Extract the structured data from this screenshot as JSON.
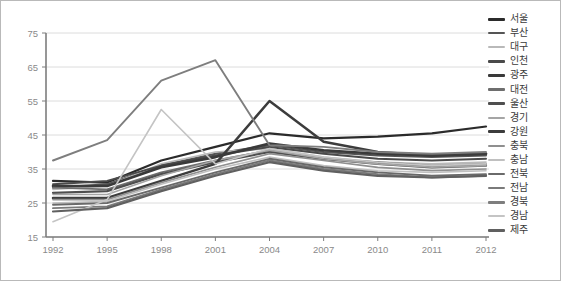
{
  "chart_data": {
    "type": "line",
    "title": "",
    "xlabel": "",
    "ylabel": "",
    "categories": [
      "1992",
      "1995",
      "1998",
      "2001",
      "2004",
      "2007",
      "2010",
      "2011",
      "2012"
    ],
    "x": [
      1992,
      1995,
      1998,
      2001,
      2004,
      2007,
      2010,
      2011,
      2012
    ],
    "ylim": [
      15,
      75
    ],
    "yticks": [
      15,
      25,
      35,
      45,
      55,
      65,
      75
    ],
    "grid": "horizontal",
    "legend_position": "right",
    "series": [
      {
        "name": "서울",
        "color": "#2b2b2b",
        "width": 2.2,
        "values": [
          31.5,
          31.0,
          37.5,
          41.5,
          45.5,
          44.0,
          44.5,
          45.5,
          47.5
        ]
      },
      {
        "name": "부산",
        "color": "#555555",
        "width": 2.0,
        "values": [
          29.5,
          30.5,
          36.0,
          39.5,
          42.0,
          40.0,
          39.0,
          38.5,
          39.0
        ]
      },
      {
        "name": "대구",
        "color": "#b9b9b9",
        "width": 1.7,
        "values": [
          29.0,
          30.0,
          36.5,
          40.0,
          41.0,
          38.5,
          37.0,
          36.5,
          37.0
        ]
      },
      {
        "name": "인천",
        "color": "#4a4a4a",
        "width": 2.0,
        "values": [
          30.5,
          31.5,
          36.0,
          39.0,
          41.5,
          39.5,
          38.0,
          37.5,
          38.0
        ]
      },
      {
        "name": "광주",
        "color": "#3a3a3a",
        "width": 2.6,
        "values": [
          30.0,
          30.0,
          35.5,
          38.5,
          42.5,
          40.5,
          39.5,
          39.0,
          39.5
        ]
      },
      {
        "name": "대전",
        "color": "#6e6e6e",
        "width": 1.8,
        "values": [
          29.5,
          29.0,
          34.0,
          37.5,
          40.5,
          38.0,
          37.0,
          36.0,
          36.5
        ]
      },
      {
        "name": "울산",
        "color": "#4f4f4f",
        "width": 2.2,
        "values": [
          28.0,
          28.5,
          33.5,
          37.0,
          40.0,
          38.0,
          36.5,
          35.5,
          36.0
        ]
      },
      {
        "name": "경기",
        "color": "#a5a5a5",
        "width": 1.6,
        "values": [
          27.5,
          27.5,
          33.0,
          37.5,
          40.5,
          38.0,
          36.5,
          35.5,
          36.0
        ]
      },
      {
        "name": "강원",
        "color": "#3c3c3c",
        "width": 2.5,
        "values": [
          26.5,
          26.5,
          31.5,
          36.5,
          55.0,
          43.0,
          40.0,
          39.0,
          39.5
        ]
      },
      {
        "name": "충북",
        "color": "#8f8f8f",
        "width": 1.7,
        "values": [
          26.0,
          26.0,
          31.0,
          35.5,
          39.5,
          37.5,
          35.5,
          34.5,
          35.0
        ]
      },
      {
        "name": "충남",
        "color": "#c0c0c0",
        "width": 1.6,
        "values": [
          25.0,
          25.5,
          30.5,
          35.0,
          38.5,
          36.0,
          34.5,
          34.0,
          34.5
        ]
      },
      {
        "name": "전북",
        "color": "#6a6a6a",
        "width": 1.9,
        "values": [
          24.5,
          25.0,
          29.5,
          34.0,
          38.0,
          35.5,
          34.0,
          33.0,
          33.5
        ]
      },
      {
        "name": "전남",
        "color": "#7a7a7a",
        "width": 1.9,
        "values": [
          23.5,
          24.0,
          29.0,
          33.5,
          37.5,
          35.0,
          33.5,
          32.5,
          33.0
        ]
      },
      {
        "name": "경북",
        "color": "#7e7e7e",
        "width": 1.9,
        "values": [
          37.5,
          43.5,
          61.0,
          67.0,
          42.0,
          41.5,
          40.0,
          39.5,
          40.0
        ]
      },
      {
        "name": "경남",
        "color": "#c4c4c4",
        "width": 1.6,
        "values": [
          19.5,
          26.0,
          52.5,
          36.5,
          41.0,
          38.5,
          37.0,
          36.0,
          36.5
        ]
      },
      {
        "name": "제주",
        "color": "#606060",
        "width": 2.2,
        "values": [
          22.5,
          23.5,
          28.5,
          33.0,
          37.0,
          34.5,
          33.0,
          32.5,
          33.0
        ]
      }
    ]
  },
  "axes": {
    "y_tick_labels": [
      "75",
      "65",
      "55",
      "45",
      "35",
      "25",
      "15"
    ],
    "x_tick_labels": [
      "1992",
      "1995",
      "1998",
      "2001",
      "2004",
      "2007",
      "2010",
      "2011",
      "2012"
    ]
  },
  "legend": {
    "items": [
      {
        "label": "서울",
        "color": "#2b2b2b",
        "thickness": 3.0
      },
      {
        "label": "부산",
        "color": "#555555",
        "thickness": 2.6
      },
      {
        "label": "대구",
        "color": "#b9b9b9",
        "thickness": 2.2
      },
      {
        "label": "인천",
        "color": "#4a4a4a",
        "thickness": 2.6
      },
      {
        "label": "광주",
        "color": "#3a3a3a",
        "thickness": 3.4
      },
      {
        "label": "대전",
        "color": "#6e6e6e",
        "thickness": 2.2
      },
      {
        "label": "울산",
        "color": "#4f4f4f",
        "thickness": 3.0
      },
      {
        "label": "경기",
        "color": "#a5a5a5",
        "thickness": 2.2
      },
      {
        "label": "강원",
        "color": "#3c3c3c",
        "thickness": 3.2
      },
      {
        "label": "충북",
        "color": "#8f8f8f",
        "thickness": 2.2
      },
      {
        "label": "충남",
        "color": "#c0c0c0",
        "thickness": 2.0
      },
      {
        "label": "전북",
        "color": "#6a6a6a",
        "thickness": 2.6
      },
      {
        "label": "전남",
        "color": "#7a7a7a",
        "thickness": 2.6
      },
      {
        "label": "경북",
        "color": "#7e7e7e",
        "thickness": 2.6
      },
      {
        "label": "경남",
        "color": "#c4c4c4",
        "thickness": 2.0
      },
      {
        "label": "제주",
        "color": "#606060",
        "thickness": 3.0
      }
    ]
  },
  "colors": {
    "border": "#b9b9b9",
    "axis": "#7d7d7d",
    "grid": "#d8d8d8",
    "tick_text": "#8a8a8a",
    "legend_text": "#3a3a3a",
    "background": "#ffffff"
  }
}
